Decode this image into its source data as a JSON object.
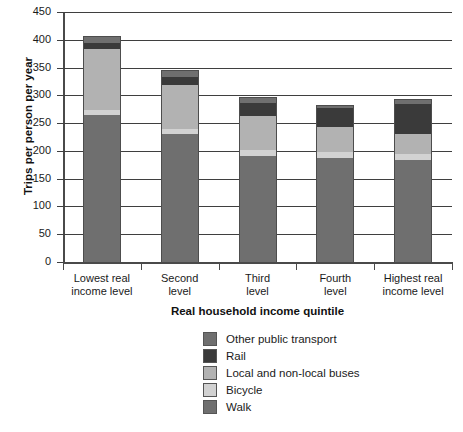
{
  "chart_data": {
    "type": "bar",
    "stacked": true,
    "title": "",
    "xlabel": "Real household income quintile",
    "ylabel": "Trips per person per year",
    "ylim": [
      0,
      450
    ],
    "yticks": [
      0,
      50,
      100,
      150,
      200,
      250,
      300,
      350,
      400,
      450
    ],
    "grid": true,
    "legend_position": "bottom",
    "categories": [
      "Lowest real income level",
      "Second level",
      "Third level",
      "Fourth level",
      "Highest real income level"
    ],
    "category_lines": [
      [
        "Lowest real",
        "income level"
      ],
      [
        "Second",
        "level"
      ],
      [
        "Third",
        "level"
      ],
      [
        "Fourth",
        "level"
      ],
      [
        "Highest real",
        "income level"
      ]
    ],
    "series": [
      {
        "name": "Walk",
        "color": "#6f6f6f",
        "values": [
          265,
          230,
          190,
          187,
          183
        ]
      },
      {
        "name": "Bicycle",
        "color": "#d2d2d2",
        "values": [
          8,
          10,
          12,
          11,
          12
        ]
      },
      {
        "name": "Local and non-local buses",
        "color": "#b2b2b2",
        "values": [
          110,
          79,
          60,
          45,
          36
        ]
      },
      {
        "name": "Rail",
        "color": "#3a3a3a",
        "values": [
          11,
          14,
          25,
          34,
          54
        ]
      },
      {
        "name": "Other public transport",
        "color": "#6f6f6f",
        "values": [
          12,
          12,
          10,
          6,
          8
        ]
      }
    ],
    "totals": [
      406,
      345,
      297,
      283,
      293
    ],
    "legend_order": [
      "Other public transport",
      "Rail",
      "Local and non-local buses",
      "Bicycle",
      "Walk"
    ]
  },
  "legend": {
    "items": [
      {
        "label": "Other public transport",
        "color": "#6f6f6f"
      },
      {
        "label": "Rail",
        "color": "#3a3a3a"
      },
      {
        "label": "Local and non-local buses",
        "color": "#b2b2b2"
      },
      {
        "label": "Bicycle",
        "color": "#d2d2d2"
      },
      {
        "label": "Walk",
        "color": "#6f6f6f"
      }
    ]
  },
  "axes": {
    "y_title": "Trips per person per year",
    "x_title": "Real household income quintile",
    "y_tick_labels": [
      "450",
      "400",
      "350",
      "300",
      "250",
      "200",
      "150",
      "100",
      "50",
      "0"
    ]
  }
}
